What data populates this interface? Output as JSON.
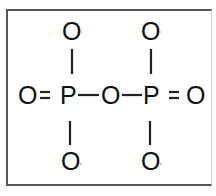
{
  "diagram": {
    "title": "",
    "type": "structural-formula",
    "atoms": {
      "top_left_o": "O",
      "top_right_o": "O",
      "left_o": "O",
      "left_p": "P",
      "bridge_o": "O",
      "right_p": "P",
      "right_o": "O",
      "bottom_left_o": "O",
      "bottom_right_o": "O"
    },
    "bonds": {
      "left_double": "=",
      "right_double": "=",
      "left_single": "—",
      "right_single": "—"
    },
    "formula_text": "O = P — O — P = O",
    "colors": {
      "ink": "#111111",
      "border": "#555555",
      "background": "#ffffff"
    }
  }
}
